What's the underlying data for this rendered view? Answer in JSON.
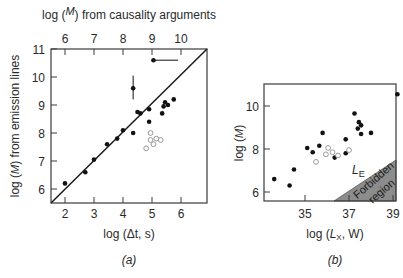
{
  "chart_data": [
    {
      "panel": "(a)",
      "type": "scatter",
      "title": "",
      "xlabel": "log (Δt, s)",
      "ylabel": "log (M/M⊙) from emission lines",
      "top_xlabel": "log (M/M⊙) from causality arguments",
      "xlim": [
        1.5,
        6.9
      ],
      "ylim": [
        5.5,
        11
      ],
      "x_ticks": [
        2,
        3,
        4,
        5,
        6
      ],
      "y_ticks": [
        6,
        7,
        8,
        9,
        10,
        11
      ],
      "top_x_ticks": [
        6,
        7,
        8,
        9,
        10
      ],
      "grid": false,
      "reference_line": {
        "description": "one-to-one relation",
        "from": [
          1.5,
          5.5
        ],
        "to": [
          6.9,
          10.9
        ]
      },
      "series": [
        {
          "name": "filled",
          "marker": "filled-circle",
          "points": [
            [
              2.0,
              6.2
            ],
            [
              2.7,
              6.6
            ],
            [
              3.0,
              7.05
            ],
            [
              3.45,
              7.6
            ],
            [
              3.8,
              7.8
            ],
            [
              4.0,
              8.1
            ],
            [
              4.35,
              8.0
            ],
            [
              4.5,
              8.75
            ],
            [
              4.6,
              8.7
            ],
            [
              4.9,
              8.85
            ],
            [
              4.9,
              8.4
            ],
            [
              5.35,
              8.7
            ],
            [
              5.4,
              8.95
            ],
            [
              5.45,
              9.1
            ],
            [
              5.55,
              9.0
            ],
            [
              5.75,
              9.2
            ]
          ]
        },
        {
          "name": "filled-with-error",
          "marker": "filled-circle",
          "points": [
            {
              "x": 4.35,
              "y": 9.6,
              "yerr": [
                9.2,
                10.05
              ]
            },
            {
              "x": 5.05,
              "y": 10.6,
              "xerr": [
                5.05,
                5.9
              ]
            }
          ]
        },
        {
          "name": "open",
          "marker": "open-circle",
          "points": [
            [
              4.8,
              7.45
            ],
            [
              4.95,
              8.0
            ],
            [
              4.95,
              7.75
            ],
            [
              5.05,
              7.6
            ],
            [
              5.15,
              7.8
            ],
            [
              5.3,
              7.75
            ]
          ]
        }
      ]
    },
    {
      "panel": "(b)",
      "type": "scatter",
      "title": "",
      "xlabel": "log (LX, W)",
      "ylabel": "log (M/M⊙)",
      "xlim": [
        33.0,
        39.3
      ],
      "ylim": [
        5.6,
        11.0
      ],
      "x_ticks": [
        35,
        37,
        39
      ],
      "y_ticks": [
        6,
        8,
        10
      ],
      "grid": false,
      "annotations": [
        "LE",
        "Forbidden region"
      ],
      "shaded_region": {
        "label": "Forbidden region",
        "vertices": [
          [
            36.3,
            5.6
          ],
          [
            39.3,
            5.6
          ],
          [
            39.3,
            8.3
          ]
        ]
      },
      "series": [
        {
          "name": "filled",
          "marker": "filled-circle",
          "points": [
            [
              33.6,
              6.6
            ],
            [
              34.3,
              6.3
            ],
            [
              34.5,
              7.05
            ],
            [
              35.1,
              8.05
            ],
            [
              35.35,
              7.85
            ],
            [
              35.65,
              8.15
            ],
            [
              35.8,
              8.75
            ],
            [
              36.35,
              7.6
            ],
            [
              36.85,
              8.45
            ],
            [
              36.85,
              7.8
            ],
            [
              37.25,
              9.65
            ],
            [
              37.4,
              8.95
            ],
            [
              37.45,
              9.25
            ],
            [
              37.55,
              9.1
            ],
            [
              37.55,
              8.7
            ],
            [
              38.0,
              8.75
            ],
            [
              39.2,
              10.55
            ]
          ]
        },
        {
          "name": "open",
          "marker": "open-circle",
          "points": [
            [
              35.5,
              7.4
            ],
            [
              35.95,
              7.75
            ],
            [
              36.05,
              8.05
            ],
            [
              36.25,
              7.85
            ],
            [
              36.5,
              7.7
            ],
            [
              37.0,
              7.95
            ]
          ]
        }
      ]
    }
  ],
  "labels": {
    "a_top_axis_prefix": "log (",
    "a_top_axis_M": "M",
    "a_top_axis_Msun": "M⊙",
    "a_top_axis_suffix": ") from causality arguments",
    "a_left_axis_prefix": "log (",
    "a_left_axis_M": "M",
    "a_left_axis_Msun": "M⊙",
    "a_left_axis_suffix": ") from emission lines",
    "a_bottom_axis": "log (Δt, s)",
    "a_caption": "(a)",
    "b_left_axis_prefix": "log (",
    "b_left_axis_M": "M",
    "b_left_axis_Msun": "M⊙",
    "b_left_axis_suffix": ")",
    "b_bottom_axis_pre": "log (",
    "b_bottom_axis_L": "L",
    "b_bottom_axis_sub": "X",
    "b_bottom_axis_post": ", W)",
    "b_caption": "(b)",
    "b_LE_main": "L",
    "b_LE_sub": "E",
    "b_forbidden_1": "Forbidden",
    "b_forbidden_2": "region"
  },
  "colors": {
    "axis": "#3a3a3a",
    "filled_marker": "#111111",
    "open_marker": "#9a9a9a",
    "forbidden_fill": "#8c8c8c"
  }
}
